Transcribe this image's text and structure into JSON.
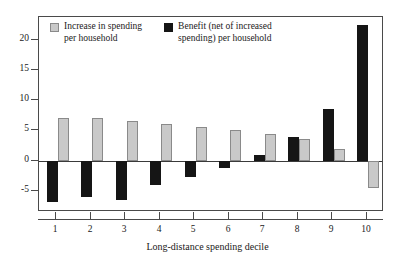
{
  "chart_data": {
    "type": "bar",
    "title": "",
    "xlabel": "Long-distance spending decile",
    "ylabel": "",
    "categories": [
      "1",
      "2",
      "3",
      "4",
      "5",
      "6",
      "7",
      "8",
      "9",
      "10"
    ],
    "yticks": [
      -5,
      0,
      5,
      10,
      15,
      20
    ],
    "ytick_labels": [
      "-5",
      "0",
      "5",
      "10",
      "15",
      "20"
    ],
    "ylim": [
      -8.5,
      23.8
    ],
    "grid": false,
    "legend_position": "top-left",
    "series": [
      {
        "name": "Increase in spending per household",
        "legend_label": "Increase in spending\nper household",
        "color": "#c9c9c9",
        "values": [
          7.0,
          7.0,
          6.6,
          6.1,
          5.6,
          5.1,
          4.5,
          3.6,
          1.9,
          -4.5
        ]
      },
      {
        "name": "Benefit (net of increased spending) per household",
        "legend_label": "Benefit (net of increased\nspending) per household",
        "color": "#151515",
        "values": [
          -6.8,
          -6.0,
          -6.5,
          -4.0,
          -2.7,
          -1.2,
          1.0,
          4.0,
          8.5,
          22.5
        ]
      }
    ]
  }
}
